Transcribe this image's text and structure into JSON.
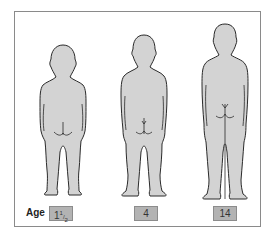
{
  "figure": {
    "age_label": "Age",
    "figures": [
      {
        "name": "toddler",
        "age_whole": "1",
        "age_num": "1",
        "age_den": "2"
      },
      {
        "name": "child",
        "age": "4"
      },
      {
        "name": "adolescent",
        "age": "14"
      }
    ]
  },
  "colors": {
    "body_fill": "#d3d3d3",
    "outline": "#2a2a2a",
    "label_box": "#b3b3b3",
    "frame_border": "#8a8a8a"
  }
}
